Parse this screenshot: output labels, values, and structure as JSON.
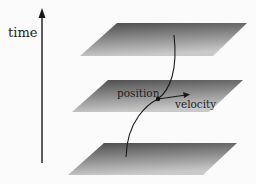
{
  "diagram": {
    "axis_label": "time",
    "point_label": "position",
    "vector_label": "velocity",
    "planes": [
      {
        "id": "top",
        "points": "117,23 247,23 213,56 80,56"
      },
      {
        "id": "middle",
        "points": "108,80 243,80 209,112 72,112"
      },
      {
        "id": "bottom",
        "points": "104,143 237,143 203,175 68,175"
      }
    ],
    "colors": {
      "plane_dark": "#555555",
      "plane_light": "#c8c8c8",
      "line": "#1a1a1a",
      "background": "#fbfbfb"
    }
  }
}
